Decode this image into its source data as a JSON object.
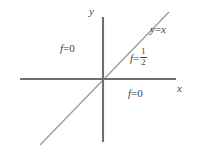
{
  "figure": {
    "background_color": "#ffffff",
    "axis_color": "#6e6e6e",
    "line_color": "#9a9a9a",
    "text_color": "#444444"
  },
  "axes": {
    "x_label": "x",
    "y_label": "y",
    "origin": {
      "x": 103,
      "y": 79
    },
    "x_axis": {
      "x1": 20,
      "y1": 79,
      "x2": 176,
      "y2": 79
    },
    "y_axis": {
      "x1": 103,
      "y1": 17,
      "x2": 103,
      "y2": 142
    }
  },
  "line": {
    "label": "y = x",
    "equation_lhs": "y",
    "equation_op": "=",
    "equation_rhs": "x",
    "slope": 1,
    "intercept": 0,
    "endpoints": {
      "x1": 40,
      "y1": 145,
      "x2": 169,
      "y2": 12
    }
  },
  "annotations": {
    "upper_left": {
      "symbol": "f",
      "op": "=",
      "value": "0"
    },
    "on_line": {
      "symbol": "f",
      "op": "=",
      "numerator": "1",
      "denominator": "2"
    },
    "lower_right": {
      "symbol": "f",
      "op": "=",
      "value": "0"
    }
  }
}
